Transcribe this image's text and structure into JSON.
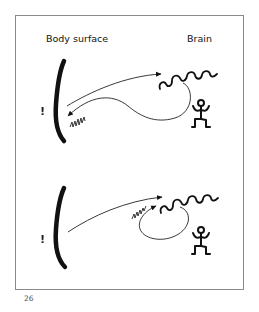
{
  "figure": {
    "labels": {
      "body_surface": "Body surface",
      "brain": "Brain"
    },
    "panels": [
      {
        "id": "top",
        "description": "Signal travels from body surface to brain and loops back to body surface",
        "marker": "!",
        "elements": [
          "body-surface-bracket",
          "afferent-arrow",
          "brain-wave",
          "return-loop-arrow",
          "body-squiggle",
          "stick-figure"
        ]
      },
      {
        "id": "bottom",
        "description": "Signal travels from body surface to brain and loops within the brain",
        "marker": "!",
        "elements": [
          "body-surface-bracket",
          "afferent-arrow",
          "brain-wave",
          "internal-loop-arrow",
          "brain-squiggle",
          "stick-figure"
        ]
      }
    ],
    "colors": {
      "ink": "#111111",
      "frame": "#8a8a8a",
      "background": "#ffffff"
    }
  },
  "page": {
    "number": "26"
  }
}
